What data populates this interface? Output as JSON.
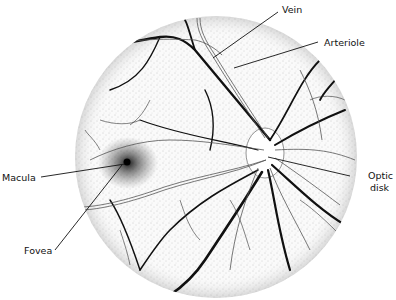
{
  "diagram": {
    "labels": {
      "vein": "Vein",
      "arteriole": "Arteriole",
      "macula": "Macula",
      "fovea": "Fovea",
      "optic_disk_line1": "Optic",
      "optic_disk_line2": "disk"
    }
  }
}
